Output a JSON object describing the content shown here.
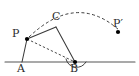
{
  "figure": {
    "kind": "geometry-diagram",
    "width": 139,
    "height": 76,
    "background_color": "#ffffff",
    "stroke_color": "#3a3a3a",
    "baseline_color": "#555555",
    "label_color": "#2b2b2b",
    "point_color": "#000000"
  },
  "points": [
    {
      "id": "A",
      "label": "A",
      "x": 22,
      "y": 62,
      "label_x": 18,
      "label_y": 63,
      "has_dot": false
    },
    {
      "id": "B",
      "label": "B",
      "x": 75,
      "y": 62,
      "label_x": 71,
      "label_y": 63,
      "has_dot": true
    },
    {
      "id": "C",
      "label": "C",
      "x": 56,
      "y": 27,
      "label_x": 52,
      "label_y": 12,
      "has_dot": false
    },
    {
      "id": "P",
      "label": "P",
      "x": 27,
      "y": 39,
      "label_x": 13,
      "label_y": 29,
      "has_dot": true
    },
    {
      "id": "Pp",
      "label": "P′",
      "x": 118,
      "y": 32,
      "label_x": 114,
      "label_y": 19,
      "has_dot": true
    }
  ],
  "segments": [
    {
      "id": "baseline",
      "from": "line-left",
      "to": "line-right",
      "style": "solid",
      "x1": 5,
      "y1": 62,
      "x2": 135,
      "y2": 62
    },
    {
      "id": "PA",
      "from": "P",
      "to": "A",
      "style": "solid",
      "x1": 27,
      "y1": 39,
      "x2": 22,
      "y2": 62
    },
    {
      "id": "PC",
      "from": "P",
      "to": "C",
      "style": "solid",
      "x1": 27,
      "y1": 39,
      "x2": 56,
      "y2": 27
    },
    {
      "id": "CB",
      "from": "C",
      "to": "B",
      "style": "solid",
      "x1": 56,
      "y1": 27,
      "x2": 75,
      "y2": 62
    },
    {
      "id": "PB",
      "from": "P",
      "to": "B",
      "style": "dashed",
      "x1": 27,
      "y1": 39,
      "x2": 75,
      "y2": 62
    }
  ],
  "arcs": [
    {
      "id": "rotation-arc",
      "style": "dashed",
      "description": "dashed arc from P over the top to P-prime",
      "path": "M 29 37 Q 76 -8 119 30"
    },
    {
      "id": "angle-arc-at-B",
      "style": "solid",
      "description": "angle mark at vertex B between BC and the baseline",
      "path": "M 66 59 A 11 11 0 0 0 86 62"
    }
  ],
  "labels": {
    "A": "A",
    "B": "B",
    "C": "C",
    "P": "P",
    "P_prime": "P′"
  }
}
